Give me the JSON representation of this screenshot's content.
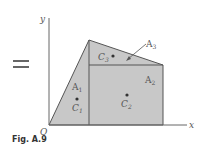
{
  "figure": {
    "caption": "Fig. A.9",
    "equals_sign": "=",
    "axes": {
      "x_label": "x",
      "y_label": "y",
      "origin_label": "O"
    },
    "areas": [
      {
        "area_label": "A",
        "area_sub": "1",
        "centroid_label": "C",
        "centroid_sub": "1",
        "shape": "triangle"
      },
      {
        "area_label": "A",
        "area_sub": "2",
        "centroid_label": "C",
        "centroid_sub": "2",
        "shape": "rectangle"
      },
      {
        "area_label": "A",
        "area_sub": "3",
        "centroid_label": "C",
        "centroid_sub": "3",
        "shape": "triangle"
      }
    ],
    "colors": {
      "fill": "#c8c8c8",
      "stroke": "#555555",
      "text": "#555555"
    }
  }
}
